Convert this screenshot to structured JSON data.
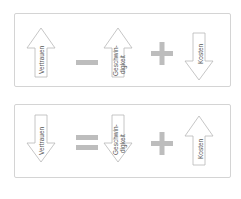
{
  "colors": {
    "arrow_stroke": "#b8b8b8",
    "arrow_fill": "#ffffff",
    "operator": "#bdbdbd",
    "border": "#d4d4d4",
    "text": "#555555"
  },
  "panels": [
    {
      "items": [
        {
          "type": "arrow",
          "direction": "up",
          "label": [
            "Vertrauen"
          ]
        },
        {
          "type": "operator",
          "symbol": "minus"
        },
        {
          "type": "arrow",
          "direction": "up",
          "label": [
            "Geschwin-",
            "digkeit"
          ]
        },
        {
          "type": "operator",
          "symbol": "plus"
        },
        {
          "type": "arrow",
          "direction": "down",
          "label": [
            "Kosten"
          ]
        }
      ]
    },
    {
      "items": [
        {
          "type": "arrow",
          "direction": "down",
          "label": [
            "Vertrauen"
          ]
        },
        {
          "type": "operator",
          "symbol": "equals"
        },
        {
          "type": "arrow",
          "direction": "down",
          "label": [
            "Geschwin-",
            "digkeit"
          ]
        },
        {
          "type": "operator",
          "symbol": "plus"
        },
        {
          "type": "arrow",
          "direction": "up",
          "label": [
            "Kosten"
          ]
        }
      ]
    }
  ]
}
